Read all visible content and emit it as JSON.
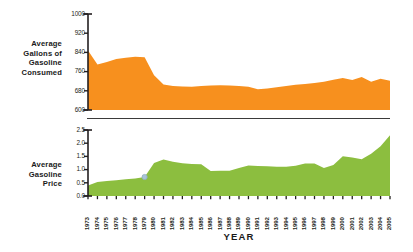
{
  "figure": {
    "xaxis_title": "YEAR",
    "colors": {
      "gallons_area": "#F7901E",
      "price_area": "#8CBE3F",
      "axis": "#231f20",
      "text": "#1a1a1a",
      "marker": "#a9c4d6"
    }
  },
  "labels": {
    "consumed": "Average\nGallons of\nGasoline\nConsumed",
    "consumed_lines": [
      "Average",
      "Gallons of",
      "Gasoline",
      "Consumed"
    ],
    "price": "Average\nGasoline\nPrice",
    "price_lines": [
      "Average",
      "Gasoline",
      "Price"
    ]
  },
  "chart_data": [
    {
      "type": "area",
      "title": "Average Gallons of Gasoline Consumed",
      "xlabel": "YEAR",
      "ylabel": "Average Gallons of Gasoline Consumed",
      "grid": false,
      "legend": "none",
      "ylim": [
        600,
        1000
      ],
      "yticks": [
        600,
        680,
        760,
        840,
        920,
        1000
      ],
      "ytick_labels": [
        "600",
        "680",
        "760",
        "840",
        "920",
        "1000"
      ],
      "categories": [
        1973,
        1974,
        1975,
        1976,
        1977,
        1978,
        1979,
        1980,
        1981,
        1982,
        1983,
        1984,
        1985,
        1986,
        1987,
        1988,
        1989,
        1990,
        1991,
        1992,
        1993,
        1994,
        1995,
        1996,
        1997,
        1998,
        1999,
        2000,
        2001,
        2002,
        2003,
        2004,
        2005
      ],
      "values": [
        848,
        790,
        800,
        812,
        818,
        822,
        820,
        745,
        706,
        700,
        698,
        697,
        700,
        702,
        703,
        702,
        700,
        697,
        686,
        690,
        695,
        700,
        705,
        708,
        712,
        718,
        726,
        733,
        725,
        737,
        718,
        730,
        722
      ]
    },
    {
      "type": "area",
      "title": "Average Gasoline Price",
      "xlabel": "YEAR",
      "ylabel": "Average Gasoline Price",
      "grid": false,
      "legend": "none",
      "ylim": [
        0.0,
        2.5
      ],
      "yticks": [
        0.0,
        0.5,
        1.0,
        1.5,
        2.0,
        2.5
      ],
      "ytick_labels": [
        "0.0",
        "0.5",
        "1.0",
        "1.5",
        "2.0",
        "2.5"
      ],
      "categories": [
        1973,
        1974,
        1975,
        1976,
        1977,
        1978,
        1979,
        1980,
        1981,
        1982,
        1983,
        1984,
        1985,
        1986,
        1987,
        1988,
        1989,
        1990,
        1991,
        1992,
        1993,
        1994,
        1995,
        1996,
        1997,
        1998,
        1999,
        2000,
        2001,
        2002,
        2003,
        2004,
        2005
      ],
      "values": [
        0.4,
        0.53,
        0.57,
        0.6,
        0.63,
        0.66,
        0.72,
        1.25,
        1.38,
        1.3,
        1.24,
        1.21,
        1.2,
        0.95,
        0.96,
        0.96,
        1.06,
        1.16,
        1.14,
        1.13,
        1.11,
        1.11,
        1.15,
        1.23,
        1.23,
        1.06,
        1.17,
        1.51,
        1.46,
        1.39,
        1.6,
        1.88,
        2.3
      ],
      "annotations": [
        {
          "name": "highlight-dot",
          "year": 1979,
          "value": 0.72,
          "color": "#a9c4d6"
        }
      ]
    }
  ]
}
